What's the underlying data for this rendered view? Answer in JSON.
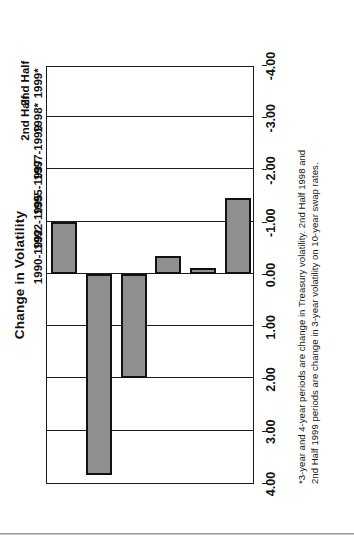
{
  "chart_data": {
    "type": "bar",
    "title": "Change in Volatility",
    "orientation": "rotated-90-ccw",
    "xlabel": "",
    "ylabel": "",
    "grid": true,
    "legend": "none",
    "categories": [
      "1990-1992",
      "1992-1995",
      "1995-1997",
      "1997-1999",
      "2nd Half\n1998*",
      "2nd Half\n1999*"
    ],
    "values": [
      -1.45,
      -0.12,
      -0.35,
      2.0,
      3.85,
      -1.0
    ],
    "ylim": [
      -4.0,
      4.0
    ],
    "tick_labels": [
      "4.00",
      "3.00",
      "2.00",
      "1.00",
      "0.00",
      "-1.00",
      "-2.00",
      "-3.00",
      "-4.00"
    ],
    "tick_values": [
      4.0,
      3.0,
      2.0,
      1.0,
      0.0,
      -1.0,
      -2.0,
      -3.0,
      -4.0
    ],
    "bar_fill_color": "#8f8f8f",
    "bar_border_color": "#111111",
    "axis_color": "#1a1a1a"
  },
  "footnote": {
    "line1": "*3-year and 4-year periods are change in Treasury volatility.  2nd Half 1998 and",
    "line2": "2nd Half 1999 periods are change in 3-year volatility on 10-year swap rates."
  }
}
